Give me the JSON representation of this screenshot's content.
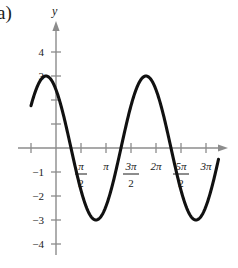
{
  "figure": {
    "part_label": "a)",
    "y_axis_label": "y"
  },
  "chart_data": {
    "type": "line",
    "title": "",
    "xlabel": "",
    "ylabel": "y",
    "grid": false,
    "legend": null,
    "function": "y = 3 cos(x + π/5)",
    "amplitude": 3,
    "period": "2π",
    "xlim": [
      "-π/2",
      "13π/4"
    ],
    "ylim": [
      -4.6,
      4.6
    ],
    "x_tick_labels": [
      "π/2",
      "π",
      "3π/2",
      "2π",
      "5π/2",
      "3π"
    ],
    "x_ticks_numeric": [
      1.5708,
      3.1416,
      4.7124,
      6.2832,
      7.854,
      9.4248
    ],
    "y_tick_labels": [
      "4",
      "3",
      "-1",
      "-2",
      "-3",
      "-4"
    ],
    "y_ticks_numeric": [
      4,
      3,
      2,
      1,
      -1,
      -2,
      -3,
      -4
    ],
    "y_ticks_unlabeled": [
      2,
      1
    ],
    "key_points": [
      {
        "x": "-π/2",
        "y": 2.55,
        "note": "left end of curve"
      },
      {
        "x": "-π/5",
        "y": 3,
        "note": "maximum"
      },
      {
        "x": "0.31π",
        "y": 0,
        "note": "descending zero"
      },
      {
        "x": "0.8π",
        "y": -3,
        "note": "minimum"
      },
      {
        "x": "1.31π",
        "y": 0,
        "note": "ascending zero"
      },
      {
        "x": "1.8π",
        "y": 3,
        "note": "maximum"
      },
      {
        "x": "2.31π",
        "y": 0,
        "note": "descending zero"
      },
      {
        "x": "2.8π",
        "y": -3,
        "note": "minimum"
      },
      {
        "x": "13π/4",
        "y": -2.7,
        "note": "right end of curve"
      }
    ],
    "curve_color": "#111111",
    "axis_color": "#8c8c8c"
  },
  "ticks": {
    "x": [
      {
        "id": "x-tick-neg-half-pi",
        "label": "",
        "kind": "plain"
      },
      {
        "id": "x-tick-half-pi",
        "label": "π",
        "denom": "2",
        "kind": "fraction"
      },
      {
        "id": "x-tick-pi",
        "label": "π",
        "kind": "plain"
      },
      {
        "id": "x-tick-three-half-pi",
        "label": "3π",
        "denom": "2",
        "kind": "fraction"
      },
      {
        "id": "x-tick-two-pi",
        "label": "2π",
        "kind": "plain"
      },
      {
        "id": "x-tick-five-half-pi",
        "label": "5π",
        "denom": "2",
        "kind": "fraction"
      },
      {
        "id": "x-tick-three-pi",
        "label": "3π",
        "kind": "plain"
      }
    ],
    "y": [
      {
        "id": "y-tick-4",
        "label": "4"
      },
      {
        "id": "y-tick-3",
        "label": "3"
      },
      {
        "id": "y-tick-2",
        "label": ""
      },
      {
        "id": "y-tick-1",
        "label": ""
      },
      {
        "id": "y-tick-minus-1",
        "label": "−1"
      },
      {
        "id": "y-tick-minus-2",
        "label": "−2"
      },
      {
        "id": "y-tick-minus-3",
        "label": "−3"
      },
      {
        "id": "y-tick-minus-4",
        "label": "−4"
      }
    ]
  }
}
